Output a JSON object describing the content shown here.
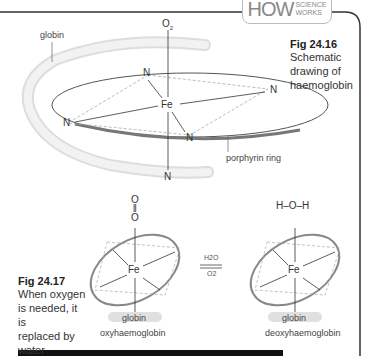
{
  "header": {
    "badge_main": "HOW",
    "badge_sub_1": "SCIENCE",
    "badge_sub_2": "WORKS"
  },
  "figure_16": {
    "title": "Fig 24.16",
    "caption_lines": [
      "Schematic",
      "drawing of",
      "haemoglobin"
    ],
    "labels": {
      "globin": "globin",
      "porphyrin_ring": "porphyrin ring",
      "o2": "O2",
      "fe": "Fe",
      "n": "N"
    }
  },
  "figure_17": {
    "title": "Fig 24.17",
    "caption_lines": [
      "When oxygen",
      "is needed, it is",
      "replaced by",
      "water"
    ],
    "left": {
      "ligand": "O=O",
      "globin": "globin",
      "name": "oxyhaemoglobin"
    },
    "right": {
      "ligand": "H–O–H",
      "globin": "globin",
      "name": "deoxyhaemoglobin"
    },
    "equilibrium": {
      "top": "H2O",
      "bottom": "O2"
    }
  },
  "colors": {
    "ring": "#888888",
    "globin_tube": "#e6e6e6",
    "border": "#222222",
    "dashed": "#aaaaaa"
  }
}
